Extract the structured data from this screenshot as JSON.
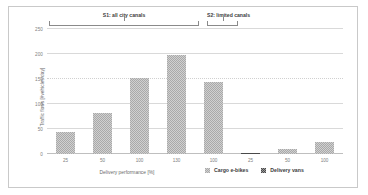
{
  "chart_data": {
    "type": "bar",
    "title": "",
    "xlabel": "Delivery performance [%]",
    "ylabel": "Traffic flows [#vehicles/day]",
    "categories": [
      "25",
      "50",
      "100",
      "130",
      "100",
      "25",
      "50",
      "100"
    ],
    "values": [
      45,
      82,
      152,
      198,
      145,
      3,
      11,
      25
    ],
    "ylim": [
      0,
      250
    ],
    "yticks": [
      0,
      50,
      100,
      150,
      200,
      250
    ],
    "ytick_labels": [
      "0",
      "50",
      "100",
      "150",
      "200",
      "250"
    ],
    "grid": true,
    "legend_position": "bottom-right",
    "series": [
      {
        "name": "Cargo e-bikes",
        "color": "#a9a9a9"
      },
      {
        "name": "Delivery vans",
        "color": "#4a4a4a"
      }
    ],
    "annotations": [
      {
        "label": "S1: all city canals",
        "covers": [
          "25",
          "50",
          "100",
          "130"
        ]
      },
      {
        "label": "S2: limited canals",
        "covers": [
          "100"
        ]
      }
    ]
  },
  "legend": {
    "items": [
      {
        "label": "Cargo e-bikes"
      },
      {
        "label": "Delivery vans"
      }
    ]
  },
  "axes": {
    "x_title": "Delivery performance [%]",
    "y_title": "Traffic flows [#vehicles/day]"
  },
  "scenarios": {
    "s1": "S1: all city canals",
    "s2": "S2: limited canals"
  }
}
